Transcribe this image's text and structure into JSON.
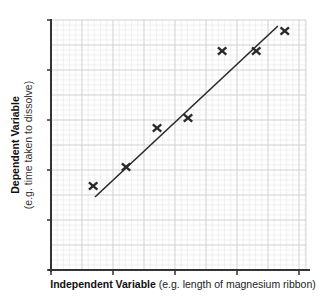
{
  "chart_data": {
    "type": "scatter",
    "title": "",
    "xlabel": "Independent Variable (e.g. length of magnesium ribbon)",
    "xlabel_bold": "Independent Variable",
    "xlabel_note": "(e.g. length of magnesium ribbon)",
    "ylabel": "Dependent Variable (e.g. time taken to dissolve)",
    "ylabel_bold": "Dependent Variable",
    "ylabel_note": "(e.g. time taken to dissolve)",
    "x_ticks": [
      0,
      1,
      2,
      3,
      4
    ],
    "y_ticks": [
      0,
      1,
      2,
      3,
      4,
      5
    ],
    "tick_labels_visible": false,
    "xlim": [
      0,
      4.2
    ],
    "ylim": [
      0,
      5
    ],
    "grid": true,
    "legend": null,
    "marker": "x",
    "points": [
      {
        "x": 0.68,
        "y": 1.68
      },
      {
        "x": 1.21,
        "y": 2.06
      },
      {
        "x": 1.71,
        "y": 2.84
      },
      {
        "x": 2.21,
        "y": 3.04
      },
      {
        "x": 2.76,
        "y": 4.38
      },
      {
        "x": 3.31,
        "y": 4.38
      },
      {
        "x": 3.77,
        "y": 4.78
      }
    ],
    "best_fit_line": {
      "x1": 0.71,
      "y1": 1.46,
      "x2": 3.66,
      "y2": 4.88
    }
  },
  "colors": {
    "axis": "#333333",
    "grid_minor": "#e6e6e6",
    "grid_major": "#cfcfcf",
    "marker": "#2a2a2a",
    "line": "#2a2a2a"
  }
}
